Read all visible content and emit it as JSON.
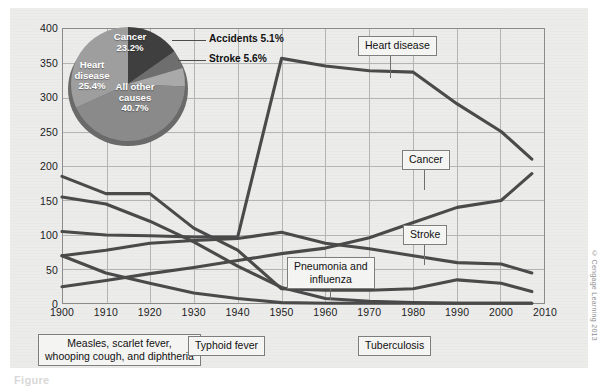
{
  "chart_data": {
    "type": "line",
    "title": "",
    "xlabel": "",
    "ylabel": "",
    "xlim": [
      1900,
      2010
    ],
    "ylim": [
      0,
      400
    ],
    "grid": true,
    "legend_position": "inline-callouts",
    "x": [
      1900,
      1910,
      1920,
      1930,
      1940,
      1950,
      1960,
      1970,
      1980,
      1990,
      2000,
      2007
    ],
    "yticks": [
      "0",
      "50",
      "100",
      "150",
      "200",
      "250",
      "300",
      "350",
      "400"
    ],
    "xticks": [
      "1900",
      "1910",
      "1920",
      "1930",
      "1940",
      "1950",
      "1960",
      "1970",
      "1980",
      "1990",
      "2000",
      "2010"
    ],
    "series": [
      {
        "name": "Heart disease",
        "values": [
          105,
          100,
          99,
          97,
          97,
          356,
          345,
          338,
          336,
          290,
          250,
          210
        ]
      },
      {
        "name": "Cancer",
        "values": [
          25,
          34,
          44,
          53,
          63,
          73,
          81,
          96,
          118,
          140,
          150,
          189
        ]
      },
      {
        "name": "Stroke",
        "values": [
          70,
          78,
          88,
          92,
          95,
          104,
          88,
          80,
          70,
          60,
          58,
          45
        ]
      },
      {
        "name": "Pneumonia and influenza",
        "values": [
          185,
          160,
          160,
          110,
          78,
          22,
          20,
          20,
          22,
          35,
          30,
          18
        ]
      },
      {
        "name": "Tuberculosis",
        "values": [
          155,
          145,
          120,
          90,
          55,
          24,
          8,
          4,
          2,
          1,
          1,
          1
        ]
      },
      {
        "name": "Measles, scarlet fever, whooping cough, and diphtheria",
        "values": [
          70,
          45,
          30,
          16,
          8,
          2,
          1,
          1,
          1,
          1,
          1,
          1
        ]
      }
    ],
    "annotations": [
      {
        "label": "Heart disease",
        "x": 1975,
        "y": 384
      },
      {
        "label": "Cancer",
        "x": 1982,
        "y": 218
      },
      {
        "label": "Stroke",
        "x": 1983,
        "y": 128
      },
      {
        "label": "Pneumonia and influenza",
        "x": 1958,
        "y": 78
      },
      {
        "label": "Measles, scarlet fever, whooping cough, and diphtheria",
        "x": 1915,
        "y": -30
      },
      {
        "label": "Typhoid fever",
        "x": 1938,
        "y": -30
      },
      {
        "label": "Tuberculosis",
        "x": 1977,
        "y": -30
      }
    ]
  },
  "pie_data": {
    "type": "pie",
    "slices": [
      {
        "label": "Cancer",
        "value": 23.2,
        "display": "23.2%",
        "color": "#3f3f3f"
      },
      {
        "label": "Accidents",
        "value": 5.1,
        "display": "5.1%",
        "color": "#6e6e6e"
      },
      {
        "label": "Stroke",
        "value": 5.6,
        "display": "5.6%",
        "color": "#a9a9a9"
      },
      {
        "label": "All other causes",
        "value": 40.7,
        "display": "40.7%",
        "color": "#8a8a8a"
      },
      {
        "label": "Heart disease",
        "value": 25.4,
        "display": "25.4%",
        "color": "#9e9e9e"
      }
    ],
    "inner_labels": [
      {
        "name": "cancer",
        "line1": "Cancer",
        "line2": "23.2%"
      },
      {
        "name": "heart-disease",
        "line1": "Heart",
        "line2": "disease",
        "line3": "25.4%"
      },
      {
        "name": "all-other-causes",
        "line1": "All other",
        "line2": "causes",
        "line3": "40.7%"
      }
    ],
    "outer_labels": [
      {
        "name": "accidents",
        "text": "Accidents 5.1%"
      },
      {
        "name": "stroke",
        "text": "Stroke 5.6%"
      }
    ]
  },
  "callouts": {
    "heart_disease": "Heart disease",
    "cancer": "Cancer",
    "stroke": "Stroke",
    "pneumonia": "Pneumonia and\ninfluenza",
    "pneumonia_l1": "Pneumonia and",
    "pneumonia_l2": "influenza",
    "measles_l1": "Measles, scarlet fever,",
    "measles_l2": "whooping cough, and diphtheria",
    "typhoid": "Typhoid fever",
    "tuberculosis": "Tuberculosis"
  },
  "credit": "© Cengage Learning 2013",
  "figure_caption": "Figure"
}
